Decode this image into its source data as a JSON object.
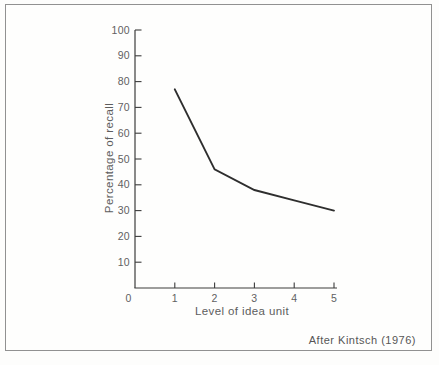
{
  "figure": {
    "caption": "After Kintsch (1976)"
  },
  "chart_data": {
    "type": "line",
    "title": "",
    "xlabel": "Level of idea unit",
    "ylabel": "Percentage of recall",
    "x": [
      1,
      2,
      3,
      4,
      5
    ],
    "y": [
      77,
      46,
      38,
      34,
      30
    ],
    "xlim": [
      0,
      5
    ],
    "ylim": [
      0,
      100
    ],
    "x_tick_labels": [
      "0",
      "1",
      "2",
      "3",
      "4",
      "5"
    ],
    "x_tick_values": [
      0,
      1,
      2,
      3,
      4,
      5
    ],
    "y_tick_labels": [
      "10",
      "20",
      "30",
      "40",
      "50",
      "60",
      "70",
      "80",
      "90",
      "100"
    ],
    "y_tick_values": [
      10,
      20,
      30,
      40,
      50,
      60,
      70,
      80,
      90,
      100
    ],
    "grid": false,
    "legend": null
  },
  "colors": {
    "curve": "#2e2e2e",
    "axis": "#3c3c3c",
    "tick_text": "#616161",
    "label_text": "#5d5d5d",
    "frame_border": "#919191",
    "background": "#fdfdfc"
  }
}
